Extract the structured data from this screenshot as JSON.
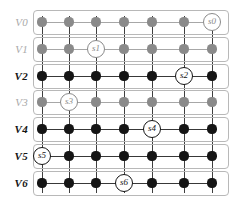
{
  "figure": {
    "type": "layered-grid-graph",
    "width": 242,
    "height": 207,
    "background": "#ffffff",
    "panel_border_color": "#b8b8b8",
    "active_color": "#151515",
    "inactive_color": "#8a8a8a",
    "inactive_label_color": "#a9a9a9",
    "columns": 7,
    "rows": 7,
    "column_x": [
      42,
      69,
      96,
      124,
      152,
      184,
      212
    ],
    "row_y": [
      22,
      49,
      76,
      102,
      129,
      156,
      183
    ],
    "panel_left": 33,
    "panel_right": 229
  },
  "rows": [
    {
      "label": "V0",
      "state": "inactive",
      "sensor": {
        "name": "s0",
        "column": 7
      },
      "nodes": [
        {
          "column": 1,
          "state": "inactive"
        },
        {
          "column": 2,
          "state": "inactive"
        },
        {
          "column": 3,
          "state": "inactive"
        },
        {
          "column": 4,
          "state": "inactive"
        },
        {
          "column": 5,
          "state": "inactive"
        },
        {
          "column": 6,
          "state": "inactive"
        }
      ]
    },
    {
      "label": "V1",
      "state": "inactive",
      "sensor": {
        "name": "s1",
        "column": 3
      },
      "nodes": [
        {
          "column": 1,
          "state": "inactive"
        },
        {
          "column": 2,
          "state": "inactive"
        },
        {
          "column": 4,
          "state": "inactive"
        },
        {
          "column": 5,
          "state": "inactive"
        },
        {
          "column": 6,
          "state": "inactive"
        },
        {
          "column": 7,
          "state": "inactive"
        }
      ]
    },
    {
      "label": "V2",
      "state": "active",
      "sensor": {
        "name": "s2",
        "column": 6
      },
      "nodes": [
        {
          "column": 1,
          "state": "active"
        },
        {
          "column": 2,
          "state": "active"
        },
        {
          "column": 3,
          "state": "active"
        },
        {
          "column": 4,
          "state": "active"
        },
        {
          "column": 5,
          "state": "active"
        },
        {
          "column": 7,
          "state": "active"
        }
      ]
    },
    {
      "label": "V3",
      "state": "inactive",
      "sensor": {
        "name": "s3",
        "column": 2
      },
      "nodes": [
        {
          "column": 1,
          "state": "inactive"
        },
        {
          "column": 3,
          "state": "inactive"
        },
        {
          "column": 4,
          "state": "inactive"
        },
        {
          "column": 5,
          "state": "inactive"
        },
        {
          "column": 6,
          "state": "inactive"
        },
        {
          "column": 7,
          "state": "inactive"
        }
      ]
    },
    {
      "label": "V4",
      "state": "active",
      "sensor": {
        "name": "s4",
        "column": 5
      },
      "nodes": [
        {
          "column": 1,
          "state": "active"
        },
        {
          "column": 2,
          "state": "active"
        },
        {
          "column": 3,
          "state": "active"
        },
        {
          "column": 4,
          "state": "active"
        },
        {
          "column": 6,
          "state": "active"
        },
        {
          "column": 7,
          "state": "active"
        }
      ]
    },
    {
      "label": "V5",
      "state": "active",
      "sensor": {
        "name": "s5",
        "column": 1
      },
      "nodes": [
        {
          "column": 2,
          "state": "active"
        },
        {
          "column": 3,
          "state": "active"
        },
        {
          "column": 4,
          "state": "active"
        },
        {
          "column": 5,
          "state": "active"
        },
        {
          "column": 6,
          "state": "active"
        },
        {
          "column": 7,
          "state": "active"
        }
      ]
    },
    {
      "label": "V6",
      "state": "active",
      "sensor": {
        "name": "s6",
        "column": 4
      },
      "nodes": [
        {
          "column": 1,
          "state": "active"
        },
        {
          "column": 2,
          "state": "active"
        },
        {
          "column": 3,
          "state": "active"
        },
        {
          "column": 5,
          "state": "active"
        },
        {
          "column": 6,
          "state": "active"
        },
        {
          "column": 7,
          "state": "active"
        }
      ]
    }
  ]
}
